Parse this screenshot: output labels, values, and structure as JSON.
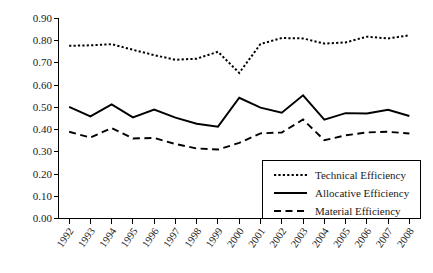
{
  "chart_data": {
    "type": "line",
    "title": "",
    "subtitle": "",
    "xlabel": "",
    "ylabel": "",
    "grid": false,
    "legend_position": "bottom-right",
    "ylim": [
      0.0,
      0.9
    ],
    "ytick_labels": [
      "0.90",
      "0.80",
      "0.70",
      "0.60",
      "0.50",
      "0.40",
      "0.30",
      "0.20",
      "0.10",
      "0.00"
    ],
    "ytick_values": [
      0.9,
      0.8,
      0.7,
      0.6,
      0.5,
      0.4,
      0.3,
      0.2,
      0.1,
      0.0
    ],
    "categories": [
      "1992",
      "1993",
      "1994",
      "1995",
      "1996",
      "1997",
      "1998",
      "1999",
      "2000",
      "2001",
      "2002",
      "2003",
      "2004",
      "2005",
      "2006",
      "2007",
      "2008"
    ],
    "x": [
      1992,
      1993,
      1994,
      1995,
      1996,
      1997,
      1998,
      1999,
      2000,
      2001,
      2002,
      2003,
      2004,
      2005,
      2006,
      2007,
      2008
    ],
    "series": [
      {
        "name": "Technical Efficiency",
        "style": "dotted",
        "color": "#000000",
        "values": [
          0.775,
          0.777,
          0.782,
          0.757,
          0.733,
          0.712,
          0.717,
          0.748,
          0.653,
          0.783,
          0.81,
          0.808,
          0.785,
          0.79,
          0.816,
          0.808,
          0.822
        ]
      },
      {
        "name": "Allocative Efficiency",
        "style": "solid",
        "color": "#000000",
        "values": [
          0.5,
          0.457,
          0.511,
          0.453,
          0.488,
          0.452,
          0.424,
          0.411,
          0.541,
          0.497,
          0.474,
          0.552,
          0.443,
          0.472,
          0.47,
          0.487,
          0.459
        ]
      },
      {
        "name": "Material Efficiency",
        "style": "dashed",
        "color": "#000000",
        "values": [
          0.388,
          0.362,
          0.405,
          0.358,
          0.36,
          0.333,
          0.313,
          0.308,
          0.338,
          0.381,
          0.385,
          0.443,
          0.35,
          0.372,
          0.385,
          0.388,
          0.38
        ]
      }
    ]
  },
  "legend": {
    "items": [
      {
        "label": "Technical Efficiency",
        "style": "dotted"
      },
      {
        "label": "Allocative Efficiency",
        "style": "solid"
      },
      {
        "label": "Material Efficiency",
        "style": "dashed"
      }
    ]
  }
}
